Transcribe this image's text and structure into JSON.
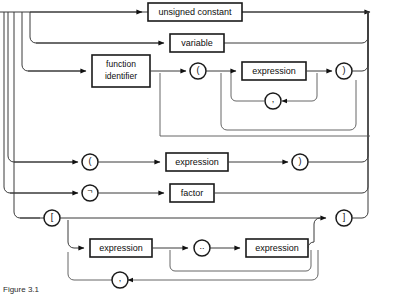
{
  "diagram": {
    "kind": "syntax-railroad-diagram",
    "title": "factor",
    "caption": "Figure 3.1",
    "colors": {
      "background": "#ffffff",
      "rail": "#3a3a3a",
      "box_stroke": "#1a1a1a",
      "text": "#0d0d0d"
    },
    "alternatives": [
      {
        "id": "unsigned-constant",
        "label": "unsigned constant",
        "row": 1,
        "node_type": "nonterminal-box"
      },
      {
        "id": "variable",
        "label": "variable",
        "row": 2,
        "node_type": "nonterminal-box"
      },
      {
        "id": "function-call",
        "row": 3,
        "node_type": "sequence",
        "nodes": [
          {
            "id": "function-identifier",
            "label": "function identifier",
            "line1": "function",
            "line2": "identifier",
            "node_type": "nonterminal-box"
          },
          {
            "id": "lparen",
            "label": "(",
            "node_type": "terminal-circle"
          },
          {
            "id": "arg-expression",
            "label": "expression",
            "node_type": "nonterminal-box"
          },
          {
            "id": "arg-separator",
            "label": ",",
            "node_type": "terminal-circle"
          },
          {
            "id": "rparen",
            "label": ")",
            "node_type": "terminal-circle"
          }
        ]
      },
      {
        "id": "parenthesized-expression",
        "row": 4,
        "node_type": "sequence",
        "nodes": [
          {
            "id": "paren-open",
            "label": "(",
            "node_type": "terminal-circle"
          },
          {
            "id": "paren-expression",
            "label": "expression",
            "node_type": "nonterminal-box"
          },
          {
            "id": "paren-close",
            "label": ")",
            "node_type": "terminal-circle"
          }
        ]
      },
      {
        "id": "negation",
        "row": 5,
        "node_type": "sequence",
        "nodes": [
          {
            "id": "not-operator",
            "label": "¬",
            "node_type": "terminal-circle"
          },
          {
            "id": "factor",
            "label": "factor",
            "node_type": "nonterminal-box"
          }
        ]
      },
      {
        "id": "set-constructor",
        "row": 6,
        "node_type": "sequence",
        "nodes": [
          {
            "id": "bracket-open",
            "label": "[",
            "node_type": "terminal-circle"
          },
          {
            "id": "set-expression-first",
            "label": "expression",
            "node_type": "nonterminal-box"
          },
          {
            "id": "range-operator",
            "label": "..",
            "node_type": "terminal-circle"
          },
          {
            "id": "set-expression-second",
            "label": "expression",
            "node_type": "nonterminal-box"
          },
          {
            "id": "set-separator",
            "label": ",",
            "node_type": "terminal-circle"
          },
          {
            "id": "bracket-close",
            "label": "]",
            "node_type": "terminal-circle"
          }
        ]
      }
    ]
  }
}
